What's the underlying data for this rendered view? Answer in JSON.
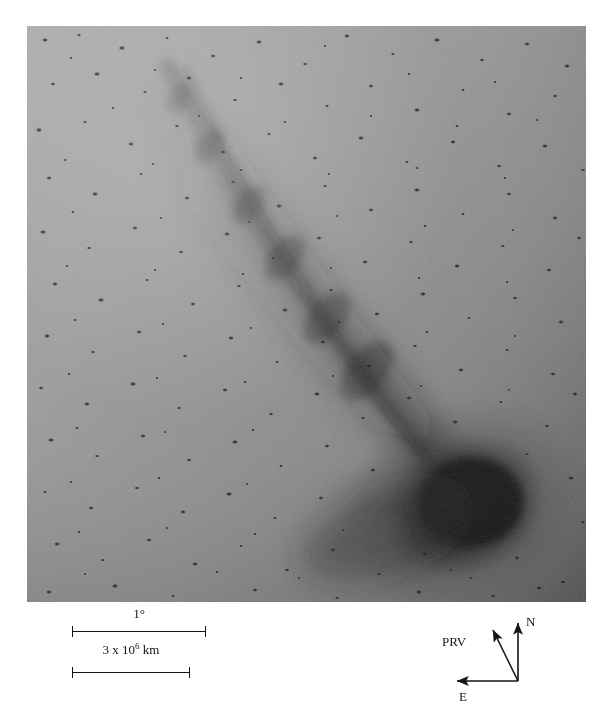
{
  "figure": {
    "type": "astronomical-photographic-plate",
    "plate": {
      "background_tone": "#8e8e8e",
      "darkening_direction": "toward lower-right",
      "comet_head_position": "lower-right of frame",
      "tail_direction": "toward upper-left"
    }
  },
  "scale": {
    "angular": {
      "label": "1°",
      "bar_length_px": 134
    },
    "linear": {
      "label_prefix": "3 x 10",
      "label_exponent": "6",
      "label_suffix": " km",
      "bar_length_px": 118
    }
  },
  "compass": {
    "north_label": "N",
    "east_label": "E",
    "prv_label": "PRV"
  },
  "caption": {
    "sliver_text": ""
  }
}
